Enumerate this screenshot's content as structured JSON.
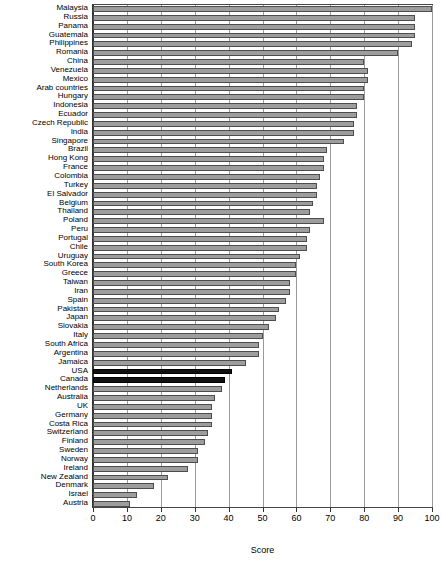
{
  "chart_data": {
    "type": "bar",
    "orientation": "horizontal",
    "title": "",
    "xlabel": "Score",
    "ylabel": "",
    "xlim": [
      0,
      100
    ],
    "xticks": [
      0,
      10,
      20,
      30,
      40,
      50,
      60,
      70,
      80,
      90,
      100
    ],
    "grid": true,
    "legend": false,
    "bar_color": "#9d9d9d",
    "highlight_color": "#111111",
    "highlighted": [
      "USA",
      "Canada"
    ],
    "categories": [
      "Malaysia",
      "Russia",
      "Panama",
      "Guatemala",
      "Philippines",
      "Romania",
      "China",
      "Venezuela",
      "Mexico",
      "Arab countries",
      "Hungary",
      "Indonesia",
      "Ecuador",
      "Czech Republic",
      "India",
      "Singapore",
      "Brazil",
      "Hong Kong",
      "France",
      "Colombia",
      "Turkey",
      "El Salvador",
      "Belgium",
      "Thailand",
      "Poland",
      "Peru",
      "Portugal",
      "Chile",
      "Uruguay",
      "South Korea",
      "Greece",
      "Taiwan",
      "Iran",
      "Spain",
      "Pakistan",
      "Japan",
      "Slovakia",
      "Italy",
      "South Africa",
      "Argentina",
      "Jamaica",
      "USA",
      "Canada",
      "Netherlands",
      "Australia",
      "UK",
      "Germany",
      "Costa Rica",
      "Switzerland",
      "Finland",
      "Sweden",
      "Norway",
      "Ireland",
      "New Zealand",
      "Denmark",
      "Israel",
      "Austria"
    ],
    "values": [
      100,
      95,
      95,
      95,
      94,
      90,
      80,
      81,
      81,
      80,
      80,
      78,
      78,
      77,
      77,
      74,
      69,
      68,
      68,
      67,
      66,
      66,
      65,
      64,
      68,
      64,
      63,
      63,
      61,
      60,
      60,
      58,
      58,
      57,
      55,
      54,
      52,
      50,
      49,
      49,
      45,
      41,
      39,
      38,
      36,
      35,
      35,
      35,
      34,
      33,
      31,
      31,
      28,
      22,
      18,
      13,
      11
    ]
  }
}
